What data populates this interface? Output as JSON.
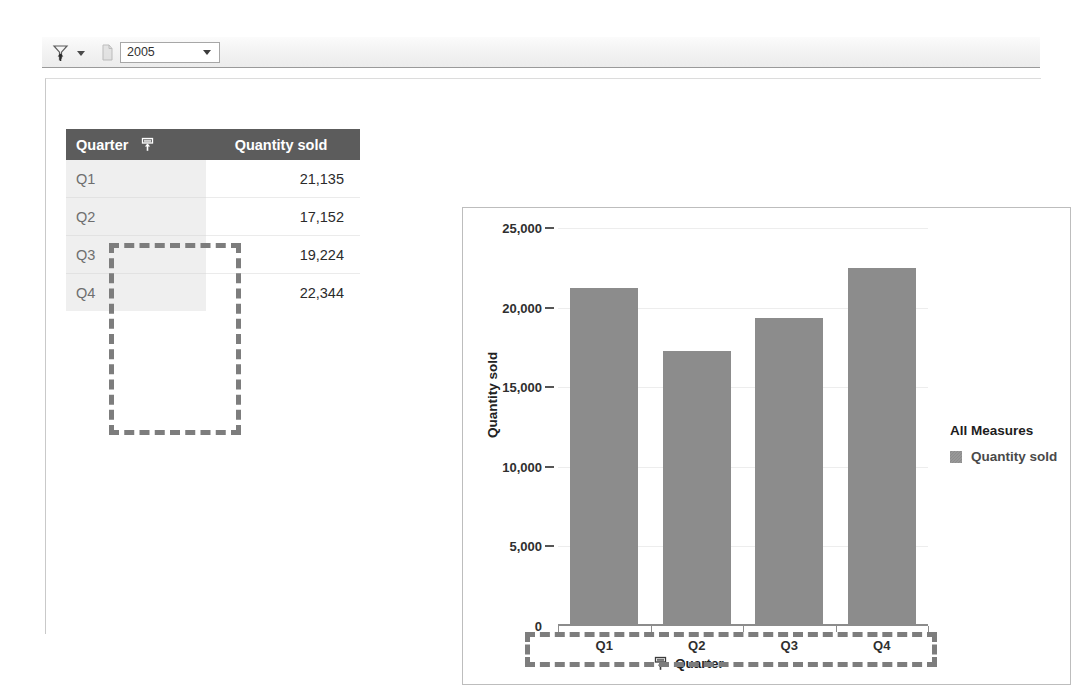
{
  "toolbar": {
    "drill_button": {
      "icon": "filter-drill-icon",
      "label": ""
    },
    "dropdown_caret": {
      "icon": "chevron-down-icon"
    },
    "page_icon": {
      "icon": "page-icon"
    },
    "year_select": {
      "value": "2005",
      "caret_icon": "chevron-down-icon",
      "options": [
        "2005"
      ]
    }
  },
  "crosstab": {
    "columns": [
      "Quarter",
      "Quantity sold"
    ],
    "header_icon": "drill-up-icon",
    "rows": [
      {
        "quarter": "Q1",
        "quantity_sold": "21,135"
      },
      {
        "quarter": "Q2",
        "quantity_sold": "17,152"
      },
      {
        "quarter": "Q3",
        "quantity_sold": "19,224"
      },
      {
        "quarter": "Q4",
        "quantity_sold": "22,344"
      }
    ]
  },
  "chart": {
    "y_axis_title": "Quantity sold",
    "x_axis_title": "Quarter",
    "x_axis_title_icon": "drill-up-icon",
    "legend_title": "All Measures",
    "legend_items": [
      {
        "label": "Quantity sold",
        "color": "#8c8c8c"
      }
    ]
  },
  "chart_data": {
    "type": "bar",
    "title": "",
    "xlabel": "Quarter",
    "ylabel": "Quantity sold",
    "categories": [
      "Q1",
      "Q2",
      "Q3",
      "Q4"
    ],
    "series": [
      {
        "name": "Quantity sold",
        "color": "#8c8c8c",
        "values": [
          21135,
          17152,
          19224,
          22344
        ]
      }
    ],
    "ylim": [
      0,
      25000
    ],
    "yticks": [
      0,
      5000,
      10000,
      15000,
      20000,
      25000
    ],
    "ytick_labels": [
      "0",
      "5,000",
      "10,000",
      "15,000",
      "20,000",
      "25,000"
    ],
    "grid": true,
    "legend_position": "right"
  }
}
